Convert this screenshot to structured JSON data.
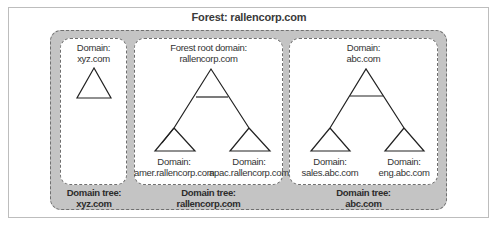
{
  "forest": {
    "title": "Forest: rallencorp.com"
  },
  "trees": [
    {
      "root": {
        "line1": "Domain:",
        "line2": "xyz.com"
      },
      "tree_label": {
        "line1": "Domain tree:",
        "line2": "xyz.com"
      },
      "children": []
    },
    {
      "root": {
        "line1": "Forest root domain:",
        "line2": "rallencorp.com"
      },
      "tree_label": {
        "line1": "Domain tree:",
        "line2": "rallencorp.com"
      },
      "children": [
        {
          "line1": "Domain:",
          "line2": "amer.rallencorp.com"
        },
        {
          "line1": "Domain:",
          "line2": "apac.rallencorp.com"
        }
      ]
    },
    {
      "root": {
        "line1": "Domain:",
        "line2": "abc.com"
      },
      "tree_label": {
        "line1": "Domain tree:",
        "line2": "abc.com"
      },
      "children": [
        {
          "line1": "Domain:",
          "line2": "sales.abc.com"
        },
        {
          "line1": "Domain:",
          "line2": "eng.abc.com"
        }
      ]
    }
  ],
  "colors": {
    "forest_fill": "#c4c4c4",
    "dashed_border": "#6f6f6f",
    "panel_fill": "#ffffff",
    "line": "#222222"
  }
}
